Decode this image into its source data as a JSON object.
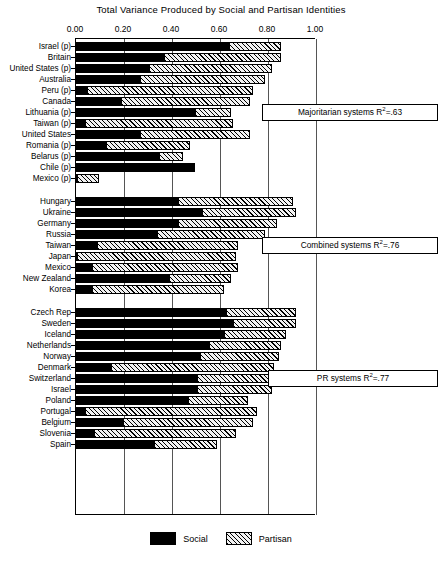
{
  "chart_data": {
    "type": "bar",
    "orientation": "horizontal",
    "stacked": true,
    "title": "Total Variance Produced by Social and Partisan Identities",
    "xlabel": "",
    "ylabel": "",
    "xlim": [
      0.0,
      1.0
    ],
    "xticks": [
      "0.00",
      "0.20",
      "0.40",
      "0.60",
      "0.80",
      "1.00"
    ],
    "xtick_values": [
      0.0,
      0.2,
      0.4,
      0.6,
      0.8,
      1.0
    ],
    "grid": true,
    "legend_position": "bottom",
    "series": [
      {
        "name": "Social",
        "values": [
          0.64,
          0.37,
          0.31,
          0.27,
          0.05,
          0.19,
          0.5,
          0.04,
          0.27,
          0.13,
          0.35,
          0.49,
          0.01,
          0.43,
          0.53,
          0.43,
          0.34,
          0.09,
          0.01,
          0.07,
          0.39,
          0.07,
          0.63,
          0.66,
          0.62,
          0.56,
          0.52,
          0.15,
          0.51,
          0.51,
          0.47,
          0.04,
          0.2,
          0.08,
          0.33
        ]
      },
      {
        "name": "Partisan",
        "values": [
          0.22,
          0.49,
          0.51,
          0.52,
          0.69,
          0.54,
          0.15,
          0.62,
          0.46,
          0.35,
          0.1,
          0.01,
          0.09,
          0.48,
          0.39,
          0.41,
          0.45,
          0.59,
          0.66,
          0.61,
          0.26,
          0.55,
          0.29,
          0.26,
          0.26,
          0.3,
          0.33,
          0.68,
          0.31,
          0.31,
          0.25,
          0.72,
          0.54,
          0.59,
          0.26
        ]
      }
    ],
    "categories": [
      "Israel (p)",
      "Britain",
      "United States (p)",
      "Australia",
      "Peru (p)",
      "Canada",
      "Lithuania (p)",
      "Taiwan (p)",
      "United States",
      "Romania (p)",
      "Belarus (p)",
      "Chile (p)",
      "Mexico (p)",
      "Hungary",
      "Ukraine",
      "Germany",
      "Russia",
      "Taiwan",
      "Japan",
      "Mexico",
      "New Zealand",
      "Korea",
      "Czech Rep",
      "Sweden",
      "Iceland",
      "Netherlands",
      "Norway",
      "Denmark",
      "Switzerland",
      "Israel",
      "Poland",
      "Portugal",
      "Belgium",
      "Slovenia",
      "Spain"
    ],
    "groups": [
      {
        "name": "Majoritarian systems",
        "annotation": "Majoritarian systems R²=.63",
        "annotation_prefix": "Majoritarian systems R",
        "annotation_sup": "2",
        "annotation_suffix": "=.63",
        "r_squared": 0.63,
        "rows": [
          {
            "label": "Israel (p)",
            "social": 0.64,
            "partisan": 0.22,
            "total": 0.86
          },
          {
            "label": "Britain",
            "social": 0.37,
            "partisan": 0.49,
            "total": 0.86
          },
          {
            "label": "United States (p)",
            "social": 0.31,
            "partisan": 0.51,
            "total": 0.82
          },
          {
            "label": "Australia",
            "social": 0.27,
            "partisan": 0.52,
            "total": 0.79
          },
          {
            "label": "Peru (p)",
            "social": 0.05,
            "partisan": 0.69,
            "total": 0.74
          },
          {
            "label": "Canada",
            "social": 0.19,
            "partisan": 0.54,
            "total": 0.73
          },
          {
            "label": "Lithuania (p)",
            "social": 0.5,
            "partisan": 0.15,
            "total": 0.65
          },
          {
            "label": "Taiwan (p)",
            "social": 0.04,
            "partisan": 0.62,
            "total": 0.66
          },
          {
            "label": "United States",
            "social": 0.27,
            "partisan": 0.46,
            "total": 0.73
          },
          {
            "label": "Romania (p)",
            "social": 0.13,
            "partisan": 0.35,
            "total": 0.48
          },
          {
            "label": "Belarus (p)",
            "social": 0.35,
            "partisan": 0.1,
            "total": 0.45
          },
          {
            "label": "Chile (p)",
            "social": 0.49,
            "partisan": 0.01,
            "total": 0.5
          },
          {
            "label": "Mexico (p)",
            "social": 0.01,
            "partisan": 0.09,
            "total": 0.1
          }
        ]
      },
      {
        "name": "Combined systems",
        "annotation": "Combined systems R²=.76",
        "annotation_prefix": "Combined systems R",
        "annotation_sup": "2",
        "annotation_suffix": "=.76",
        "r_squared": 0.76,
        "rows": [
          {
            "label": "Hungary",
            "social": 0.43,
            "partisan": 0.48,
            "total": 0.91
          },
          {
            "label": "Ukraine",
            "social": 0.53,
            "partisan": 0.39,
            "total": 0.92
          },
          {
            "label": "Germany",
            "social": 0.43,
            "partisan": 0.41,
            "total": 0.84
          },
          {
            "label": "Russia",
            "social": 0.34,
            "partisan": 0.45,
            "total": 0.79
          },
          {
            "label": "Taiwan",
            "social": 0.09,
            "partisan": 0.59,
            "total": 0.68
          },
          {
            "label": "Japan",
            "social": 0.01,
            "partisan": 0.66,
            "total": 0.67
          },
          {
            "label": "Mexico",
            "social": 0.07,
            "partisan": 0.61,
            "total": 0.68
          },
          {
            "label": "New Zealand",
            "social": 0.39,
            "partisan": 0.26,
            "total": 0.65
          },
          {
            "label": "Korea",
            "social": 0.07,
            "partisan": 0.55,
            "total": 0.62
          }
        ]
      },
      {
        "name": "PR systems",
        "annotation": "PR systems R²=.77",
        "annotation_prefix": "PR systems R",
        "annotation_sup": "2",
        "annotation_suffix": "=.77",
        "r_squared": 0.77,
        "rows": [
          {
            "label": "Czech Rep",
            "social": 0.63,
            "partisan": 0.29,
            "total": 0.92
          },
          {
            "label": "Sweden",
            "social": 0.66,
            "partisan": 0.26,
            "total": 0.92
          },
          {
            "label": "Iceland",
            "social": 0.62,
            "partisan": 0.26,
            "total": 0.88
          },
          {
            "label": "Netherlands",
            "social": 0.56,
            "partisan": 0.3,
            "total": 0.86
          },
          {
            "label": "Norway",
            "social": 0.52,
            "partisan": 0.33,
            "total": 0.85
          },
          {
            "label": "Denmark",
            "social": 0.15,
            "partisan": 0.68,
            "total": 0.83
          },
          {
            "label": "Switzerland",
            "social": 0.51,
            "partisan": 0.31,
            "total": 0.82
          },
          {
            "label": "Israel",
            "social": 0.51,
            "partisan": 0.31,
            "total": 0.82
          },
          {
            "label": "Poland",
            "social": 0.47,
            "partisan": 0.25,
            "total": 0.72
          },
          {
            "label": "Portugal",
            "social": 0.04,
            "partisan": 0.72,
            "total": 0.76
          },
          {
            "label": "Belgium",
            "social": 0.2,
            "partisan": 0.54,
            "total": 0.74
          },
          {
            "label": "Slovenia",
            "social": 0.08,
            "partisan": 0.59,
            "total": 0.67
          },
          {
            "label": "Spain",
            "social": 0.33,
            "partisan": 0.26,
            "total": 0.59
          }
        ]
      }
    ],
    "legend": [
      {
        "label": "Social",
        "swatch": "solid-black"
      },
      {
        "label": "Partisan",
        "swatch": "hatched"
      }
    ],
    "colors": {
      "social": "#000000",
      "partisan_fill": "#f2f2f2",
      "partisan_hatch": "#000000",
      "axis": "#000000",
      "grid": "#555555",
      "background": "#ffffff"
    }
  }
}
